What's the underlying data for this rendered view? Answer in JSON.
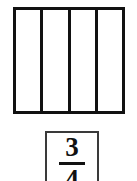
{
  "worksheet": {
    "background_color": "#ffffff",
    "line_color": "#111111",
    "label_border_color": "#3a3a3a"
  },
  "fraction_model": {
    "shape": "rectangle",
    "total_parts": 4,
    "shaded_parts": 0,
    "orientation": "vertical-strips",
    "parts": [
      {
        "index": 1,
        "shaded": false
      },
      {
        "index": 2,
        "shaded": false
      },
      {
        "index": 3,
        "shaded": false
      },
      {
        "index": 4,
        "shaded": false
      }
    ]
  },
  "fraction_label": {
    "numerator": "3",
    "denominator": "4",
    "display": "3/4"
  }
}
